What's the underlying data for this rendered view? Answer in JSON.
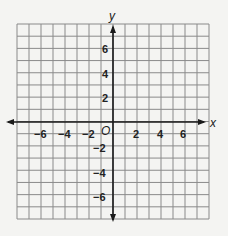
{
  "diagram": {
    "type": "coordinate-plane",
    "x_axis_label": "x",
    "y_axis_label": "y",
    "origin_label": "O",
    "x_range": [
      -8,
      8
    ],
    "y_range": [
      -8,
      8
    ],
    "x_tick_labels": [
      "−6",
      "−4",
      "−2",
      "2",
      "4",
      "6"
    ],
    "y_tick_labels": [
      "6",
      "4",
      "2",
      "−2",
      "−4",
      "−6"
    ],
    "grid_color": "#8a8a8a",
    "axis_color": "#1a1a1a",
    "background_color": "#f4f4f2"
  }
}
